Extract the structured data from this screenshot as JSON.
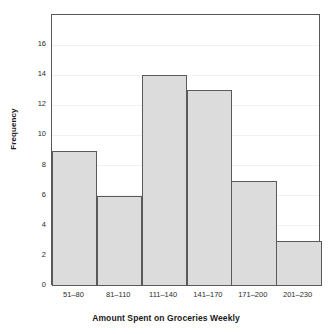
{
  "chart_data": {
    "type": "bar",
    "title": "",
    "xlabel": "Amount Spent on Groceries Weekly",
    "ylabel": "Frequency",
    "categories": [
      "51–80",
      "81–110",
      "111–140",
      "141–170",
      "171–200",
      "201–230"
    ],
    "values": [
      9,
      6,
      14,
      13,
      7,
      3
    ],
    "ylim": [
      0,
      18
    ],
    "yticks": [
      0,
      2,
      4,
      6,
      8,
      10,
      12,
      14,
      16
    ],
    "ytick_labels": [
      "0",
      "2",
      "4",
      "6",
      "8",
      "10",
      "12",
      "14",
      "16"
    ],
    "grid": true,
    "grid_axis": "y",
    "legend": null,
    "bar_fill_color": "#dcdcdc",
    "bar_edge_color": "#5a5a5c",
    "gridline_color": "#f1f1f2",
    "frame_color": "#58585a",
    "background_color": "#ffffff",
    "bars_contiguous": true
  }
}
